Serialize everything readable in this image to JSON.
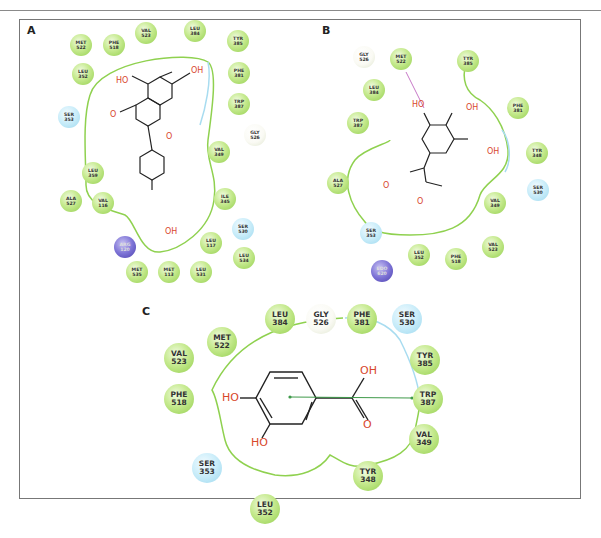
{
  "figure": {
    "panels": [
      {
        "label": "A",
        "ligand_atoms": [
          "HO",
          "OH",
          "O",
          "O",
          "OH"
        ],
        "residues": [
          {
            "name": "MET",
            "num": "522",
            "type": "hydrophobic"
          },
          {
            "name": "PHE",
            "num": "518",
            "type": "hydrophobic"
          },
          {
            "name": "VAL",
            "num": "523",
            "type": "hydrophobic"
          },
          {
            "name": "LEU",
            "num": "384",
            "type": "hydrophobic"
          },
          {
            "name": "TYR",
            "num": "385",
            "type": "hydrophobic"
          },
          {
            "name": "LEU",
            "num": "352",
            "type": "hydrophobic"
          },
          {
            "name": "PHE",
            "num": "381",
            "type": "hydrophobic"
          },
          {
            "name": "TRP",
            "num": "387",
            "type": "hydrophobic"
          },
          {
            "name": "SER",
            "num": "353",
            "type": "polar"
          },
          {
            "name": "GLY",
            "num": "526",
            "type": "glycine"
          },
          {
            "name": "VAL",
            "num": "349",
            "type": "hydrophobic"
          },
          {
            "name": "LEU",
            "num": "359",
            "type": "hydrophobic"
          },
          {
            "name": "ALA",
            "num": "527",
            "type": "hydrophobic"
          },
          {
            "name": "VAL",
            "num": "116",
            "type": "hydrophobic"
          },
          {
            "name": "ILE",
            "num": "345",
            "type": "hydrophobic"
          },
          {
            "name": "SER",
            "num": "530",
            "type": "polar"
          },
          {
            "name": "ARG",
            "num": "120",
            "type": "positive"
          },
          {
            "name": "LEU",
            "num": "117",
            "type": "hydrophobic"
          },
          {
            "name": "LEU",
            "num": "534",
            "type": "hydrophobic"
          },
          {
            "name": "MET",
            "num": "535",
            "type": "hydrophobic"
          },
          {
            "name": "MET",
            "num": "113",
            "type": "hydrophobic"
          },
          {
            "name": "LEU",
            "num": "531",
            "type": "hydrophobic"
          }
        ]
      },
      {
        "label": "B",
        "ligand_atoms": [
          "HO",
          "OH",
          "OH",
          "O",
          "O"
        ],
        "residues": [
          {
            "name": "GLY",
            "num": "526",
            "type": "glycine"
          },
          {
            "name": "MET",
            "num": "522",
            "type": "hydrophobic"
          },
          {
            "name": "TYR",
            "num": "385",
            "type": "hydrophobic"
          },
          {
            "name": "LEU",
            "num": "384",
            "type": "hydrophobic"
          },
          {
            "name": "PHE",
            "num": "381",
            "type": "hydrophobic"
          },
          {
            "name": "TRP",
            "num": "387",
            "type": "hydrophobic"
          },
          {
            "name": "TYR",
            "num": "348",
            "type": "hydrophobic"
          },
          {
            "name": "ALA",
            "num": "527",
            "type": "hydrophobic"
          },
          {
            "name": "SER",
            "num": "530",
            "type": "polar"
          },
          {
            "name": "VAL",
            "num": "349",
            "type": "hydrophobic"
          },
          {
            "name": "SER",
            "num": "353",
            "type": "polar"
          },
          {
            "name": "LEU",
            "num": "352",
            "type": "hydrophobic"
          },
          {
            "name": "PHE",
            "num": "518",
            "type": "hydrophobic"
          },
          {
            "name": "VAL",
            "num": "523",
            "type": "hydrophobic"
          },
          {
            "name": "EDO",
            "num": "620",
            "type": "positive"
          }
        ]
      },
      {
        "label": "C",
        "ligand_atoms": [
          "HO",
          "HO",
          "OH",
          "O"
        ],
        "residues": [
          {
            "name": "LEU",
            "num": "384",
            "type": "hydrophobic"
          },
          {
            "name": "GLY",
            "num": "526",
            "type": "glycine"
          },
          {
            "name": "PHE",
            "num": "381",
            "type": "hydrophobic"
          },
          {
            "name": "SER",
            "num": "530",
            "type": "polar"
          },
          {
            "name": "MET",
            "num": "522",
            "type": "hydrophobic"
          },
          {
            "name": "VAL",
            "num": "523",
            "type": "hydrophobic"
          },
          {
            "name": "TYR",
            "num": "385",
            "type": "hydrophobic"
          },
          {
            "name": "PHE",
            "num": "518",
            "type": "hydrophobic"
          },
          {
            "name": "TRP",
            "num": "387",
            "type": "hydrophobic"
          },
          {
            "name": "VAL",
            "num": "349",
            "type": "hydrophobic"
          },
          {
            "name": "SER",
            "num": "353",
            "type": "polar"
          },
          {
            "name": "TYR",
            "num": "348",
            "type": "hydrophobic"
          },
          {
            "name": "LEU",
            "num": "352",
            "type": "hydrophobic"
          }
        ]
      }
    ]
  },
  "colors": {
    "hydrophobic": "#9fd45a",
    "polar": "#a8dcf0",
    "glycine": "#f7f7ee",
    "positive": "#6a5fc8",
    "pocket_line": "#8fd14f",
    "pocket_line_polar": "#9fd7ea",
    "oxygen": "#d8472c",
    "hbond": "#c779c7",
    "pi_stack": "#3f9a4a"
  }
}
